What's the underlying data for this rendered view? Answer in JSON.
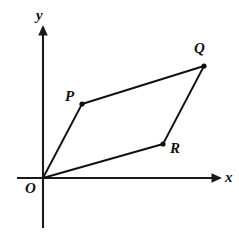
{
  "figure": {
    "kind": "coordinate-geometry-diagram",
    "background_color": "#ffffff",
    "ink_color": "#111111",
    "axis_color": "#1a1a1a",
    "width": 239,
    "height": 242
  },
  "axes": {
    "x_axis": {
      "label": "x",
      "label_x": 225,
      "label_y": 170,
      "start_x": 17,
      "end_x": 222,
      "y": 178,
      "arrow": "right"
    },
    "y_axis": {
      "label": "y",
      "label_x": 36,
      "label_y": 8,
      "x": 43,
      "start_y": 228,
      "end_y": 25,
      "arrow": "up"
    },
    "origin": {
      "x": 43,
      "y": 178
    }
  },
  "points": [
    {
      "name": "O",
      "label": "O",
      "x": 43,
      "y": 178,
      "label_x": 25,
      "label_y": 181,
      "dot": false
    },
    {
      "name": "P",
      "label": "P",
      "x": 82,
      "y": 104,
      "label_x": 65,
      "label_y": 89,
      "dot": true
    },
    {
      "name": "Q",
      "label": "Q",
      "x": 204,
      "y": 66,
      "label_x": 194,
      "label_y": 41,
      "dot": true
    },
    {
      "name": "R",
      "label": "R",
      "x": 163,
      "y": 144,
      "label_x": 170,
      "label_y": 141,
      "dot": true
    }
  ],
  "shape": {
    "name": "parallelogram-OPQR",
    "vertex_order": [
      "O",
      "P",
      "Q",
      "R"
    ],
    "closed": true,
    "path": "M 43 178 L 82 104 L 204 66 L 163 144 Z",
    "edges": [
      {
        "from": "O",
        "to": "P"
      },
      {
        "from": "P",
        "to": "Q"
      },
      {
        "from": "Q",
        "to": "R"
      },
      {
        "from": "R",
        "to": "O"
      }
    ]
  },
  "markers": {
    "dot_radius": 2.6,
    "x_arrow_points": "222,178 212,173.2 212,182.8",
    "y_arrow_points": "43,25 38.2,35 47.8,35"
  }
}
